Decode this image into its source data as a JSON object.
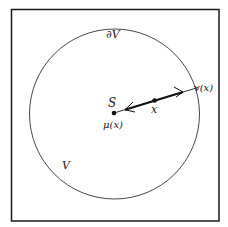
{
  "diagram": {
    "labels": {
      "boundary": "∂V",
      "region": "V",
      "center_point": "S",
      "center_map": "μ(x)",
      "point": "x",
      "boundary_map": "v(x)"
    },
    "colors": {
      "stroke": "#1a1a1a",
      "background": "#ffffff"
    }
  }
}
